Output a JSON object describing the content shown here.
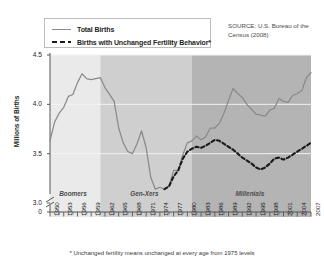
{
  "legend": {
    "entries": [
      {
        "label": "Total Births",
        "style": "solid",
        "color": "#8a8a8a"
      },
      {
        "label": "Births with Unchanged Fertility Behavior*",
        "style": "dashed",
        "color": "#1a1a1a"
      }
    ]
  },
  "source_note": "SOURCE: U.S. Bureau of the Census (2008)",
  "footnote": "* Unchanged fertility means unchanged at every age from 1975 levels",
  "bands": [
    {
      "label": "Boomers",
      "start": 1950,
      "end": 1961,
      "color": "#eaeaea"
    },
    {
      "label": "Gen-Xers",
      "start": 1961,
      "end": 1981,
      "color": "#cfcfcf"
    },
    {
      "label": "Millenials",
      "start": 1981,
      "end": 2007,
      "color": "#b4b4b4"
    }
  ],
  "chart_data": {
    "type": "line",
    "title": "",
    "xlabel": "",
    "ylabel": "Millions of Births",
    "xlim": [
      1950,
      2007
    ],
    "ylim": [
      3.0,
      4.5
    ],
    "ytick_labels": [
      "4.5",
      "4.0",
      "3.5",
      "3.0",
      "0"
    ],
    "ytick_values": [
      4.5,
      4.0,
      3.5,
      3.0
    ],
    "grid": true,
    "axis_break": true,
    "xtick_labels": [
      "1950",
      "1953",
      "1956",
      "1959",
      "1962",
      "1965",
      "1968",
      "1971",
      "1974",
      "1977",
      "1980",
      "1983",
      "1986",
      "1989",
      "1992",
      "1995",
      "1998",
      "2001",
      "2004",
      "2007"
    ],
    "xtick_values": [
      1950,
      1953,
      1956,
      1959,
      1962,
      1965,
      1968,
      1971,
      1974,
      1977,
      1980,
      1983,
      1986,
      1989,
      1992,
      1995,
      1998,
      2001,
      2004,
      2007
    ],
    "minor_ticks_every": 1,
    "legend_position": "top-left",
    "series": [
      {
        "name": "Total Births",
        "color": "#8a8a8a",
        "style": "solid",
        "x": [
          1950,
          1951,
          1952,
          1953,
          1954,
          1955,
          1956,
          1957,
          1958,
          1959,
          1960,
          1961,
          1962,
          1963,
          1964,
          1965,
          1966,
          1967,
          1968,
          1969,
          1970,
          1971,
          1972,
          1973,
          1974,
          1975,
          1976,
          1977,
          1978,
          1979,
          1980,
          1981,
          1982,
          1983,
          1984,
          1985,
          1986,
          1987,
          1988,
          1989,
          1990,
          1991,
          1992,
          1993,
          1994,
          1995,
          1996,
          1997,
          1998,
          1999,
          2000,
          2001,
          2002,
          2003,
          2004,
          2005,
          2006,
          2007
        ],
        "values": [
          3.63,
          3.82,
          3.91,
          3.97,
          4.08,
          4.1,
          4.22,
          4.31,
          4.26,
          4.25,
          4.26,
          4.27,
          4.17,
          4.1,
          4.03,
          3.76,
          3.61,
          3.52,
          3.5,
          3.6,
          3.73,
          3.56,
          3.26,
          3.14,
          3.16,
          3.14,
          3.17,
          3.33,
          3.33,
          3.49,
          3.61,
          3.63,
          3.68,
          3.64,
          3.67,
          3.76,
          3.76,
          3.81,
          3.91,
          4.04,
          4.16,
          4.11,
          4.07,
          4.0,
          3.95,
          3.9,
          3.89,
          3.88,
          3.94,
          3.96,
          4.06,
          4.03,
          4.02,
          4.09,
          4.11,
          4.14,
          4.27,
          4.32
        ]
      },
      {
        "name": "Births with Unchanged Fertility Behavior*",
        "color": "#1a1a1a",
        "style": "dashed",
        "x": [
          1975,
          1976,
          1977,
          1978,
          1979,
          1980,
          1981,
          1982,
          1983,
          1984,
          1985,
          1986,
          1987,
          1988,
          1989,
          1990,
          1991,
          1992,
          1993,
          1994,
          1995,
          1996,
          1997,
          1998,
          1999,
          2000,
          2001,
          2002,
          2003,
          2004,
          2005,
          2006,
          2007
        ],
        "values": [
          3.14,
          3.17,
          3.27,
          3.33,
          3.45,
          3.52,
          3.55,
          3.57,
          3.56,
          3.58,
          3.61,
          3.64,
          3.63,
          3.6,
          3.57,
          3.54,
          3.5,
          3.46,
          3.43,
          3.4,
          3.36,
          3.34,
          3.36,
          3.4,
          3.45,
          3.46,
          3.44,
          3.46,
          3.49,
          3.52,
          3.55,
          3.58,
          3.61
        ]
      }
    ]
  }
}
